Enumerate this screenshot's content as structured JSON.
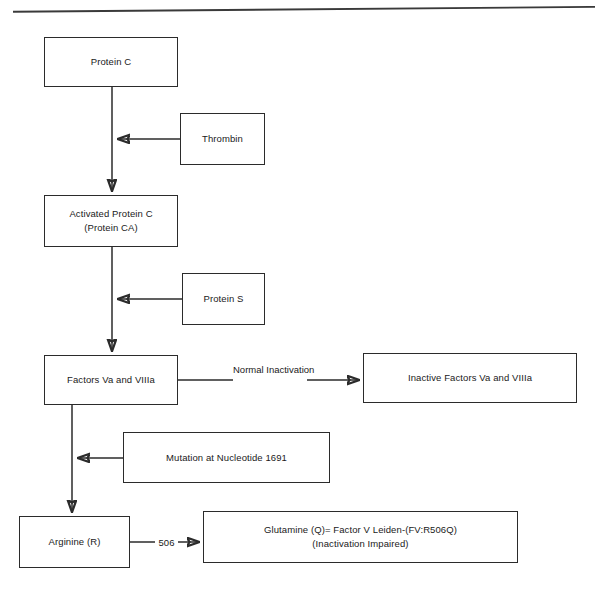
{
  "figure": {
    "kind": "flowchart"
  },
  "rule": {
    "name": "top-horizontal-rule"
  },
  "nodes": [
    {
      "id": "protein-c",
      "lines": [
        "Protein C"
      ]
    },
    {
      "id": "thrombin",
      "lines": [
        "Thrombin"
      ]
    },
    {
      "id": "activated-protein-c",
      "lines": [
        "Activated Protein C",
        "(Protein CA)"
      ]
    },
    {
      "id": "protein-s",
      "lines": [
        "Protein S"
      ]
    },
    {
      "id": "factors-va-viiia",
      "lines": [
        "Factors Va and VIIIa"
      ]
    },
    {
      "id": "inactive-factors",
      "lines": [
        "Inactive Factors Va and VIIIa"
      ]
    },
    {
      "id": "mutation",
      "lines": [
        "Mutation at Nucleotide 1691"
      ]
    },
    {
      "id": "arginine",
      "lines": [
        "Arginine (R)"
      ]
    },
    {
      "id": "glutamine",
      "lines": [
        "Glutamine (Q)= Factor V Leiden-(FV:R506Q)",
        "(Inactivation Impaired)"
      ]
    }
  ],
  "edge_labels": [
    {
      "id": "normal-inactivation",
      "lines": [
        "Normal",
        "Inactivation"
      ]
    },
    {
      "id": "residue-506",
      "lines": [
        "506"
      ]
    }
  ],
  "edges": [
    {
      "id": "protein-c-to-activated-protein-c",
      "from": "protein-c",
      "to": "activated-protein-c",
      "direction": "down"
    },
    {
      "id": "thrombin-to-activation",
      "from": "thrombin",
      "to": "protein-c-to-activated-protein-c",
      "direction": "left"
    },
    {
      "id": "apc-to-factors",
      "from": "activated-protein-c",
      "to": "factors-va-viiia",
      "direction": "down"
    },
    {
      "id": "protein-s-to-apc-action",
      "from": "protein-s",
      "to": "apc-to-factors",
      "direction": "left"
    },
    {
      "id": "factors-to-inactive",
      "from": "factors-va-viiia",
      "to": "inactive-factors",
      "direction": "right",
      "label": "normal-inactivation"
    },
    {
      "id": "factors-to-arginine",
      "from": "factors-va-viiia",
      "to": "arginine",
      "direction": "down"
    },
    {
      "id": "mutation-to-pathway",
      "from": "mutation",
      "to": "factors-to-arginine",
      "direction": "left"
    },
    {
      "id": "arginine-to-glutamine",
      "from": "arginine",
      "to": "glutamine",
      "direction": "right",
      "label": "residue-506"
    }
  ],
  "colors": {
    "ink": "#2b2b2b",
    "text": "#1a1a1a",
    "page": "#ffffff"
  }
}
